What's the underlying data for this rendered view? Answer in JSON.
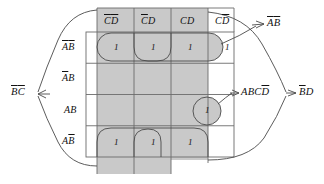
{
  "figure": {
    "type": "karnaugh-map",
    "variables": [
      "A",
      "B",
      "C",
      "D"
    ],
    "colors": {
      "group_fill": "#c9c9c9",
      "grid_line": "#6b6b6b",
      "outline": "#3a3a3a",
      "text": "#111111",
      "background": "#ffffff"
    }
  },
  "column_headers": [
    {
      "id": "col-0",
      "parts": [
        {
          "t": "C",
          "bar": true
        },
        {
          "t": "D",
          "bar": true
        }
      ]
    },
    {
      "id": "col-1",
      "parts": [
        {
          "t": "C",
          "bar": true
        },
        {
          "t": "D",
          "bar": false
        }
      ]
    },
    {
      "id": "col-2",
      "parts": [
        {
          "t": "C",
          "bar": false
        },
        {
          "t": "D",
          "bar": false
        }
      ]
    },
    {
      "id": "col-3",
      "parts": [
        {
          "t": "C",
          "bar": false
        },
        {
          "t": "D",
          "bar": true
        }
      ]
    }
  ],
  "row_headers": [
    {
      "id": "row-0",
      "parts": [
        {
          "t": "A",
          "bar": true
        },
        {
          "t": "B",
          "bar": true
        }
      ]
    },
    {
      "id": "row-1",
      "parts": [
        {
          "t": "A",
          "bar": true
        },
        {
          "t": "B",
          "bar": false
        }
      ]
    },
    {
      "id": "row-2",
      "parts": [
        {
          "t": "A",
          "bar": false
        },
        {
          "t": "B",
          "bar": false
        }
      ]
    },
    {
      "id": "row-3",
      "parts": [
        {
          "t": "A",
          "bar": false
        },
        {
          "t": "B",
          "bar": true
        }
      ]
    }
  ],
  "cells": [
    {
      "row": 0,
      "col": 0,
      "value": "1"
    },
    {
      "row": 0,
      "col": 1,
      "value": "1"
    },
    {
      "row": 0,
      "col": 2,
      "value": "1"
    },
    {
      "row": 0,
      "col": 3,
      "value": "1"
    },
    {
      "row": 1,
      "col": 0,
      "value": ""
    },
    {
      "row": 1,
      "col": 1,
      "value": ""
    },
    {
      "row": 1,
      "col": 2,
      "value": ""
    },
    {
      "row": 1,
      "col": 3,
      "value": ""
    },
    {
      "row": 2,
      "col": 0,
      "value": ""
    },
    {
      "row": 2,
      "col": 1,
      "value": ""
    },
    {
      "row": 2,
      "col": 2,
      "value": ""
    },
    {
      "row": 2,
      "col": 3,
      "value": "1"
    },
    {
      "row": 3,
      "col": 0,
      "value": "1"
    },
    {
      "row": 3,
      "col": 1,
      "value": "1"
    },
    {
      "row": 3,
      "col": 2,
      "value": "1"
    },
    {
      "row": 3,
      "col": 3,
      "value": ""
    }
  ],
  "term_labels": [
    {
      "id": "term-ab-bar",
      "parts": [
        {
          "t": "A",
          "bar": true
        },
        {
          "t": "B",
          "bar": true
        }
      ],
      "x": 268,
      "y": 26
    },
    {
      "id": "term-abcd-bar",
      "parts": [
        {
          "t": "A",
          "bar": false
        },
        {
          "t": "B",
          "bar": false
        },
        {
          "t": "C",
          "bar": false
        },
        {
          "t": "D",
          "bar": true
        }
      ],
      "x": 240,
      "y": 93
    },
    {
      "id": "term-b-bar-d",
      "parts": [
        {
          "t": "B",
          "bar": true
        },
        {
          "t": "D",
          "bar": false
        }
      ],
      "x": 300,
      "y": 93
    },
    {
      "id": "term-b-bar-c-bar",
      "parts": [
        {
          "t": "B",
          "bar": true
        },
        {
          "t": "C",
          "bar": true
        }
      ],
      "x": 12,
      "y": 93
    }
  ],
  "groups": [
    {
      "id": "group-a-bar-b-bar",
      "description": "row ABbar all four columns"
    },
    {
      "id": "group-abcd-bar",
      "description": "single minterm AB CDbar"
    },
    {
      "id": "group-b-bar-d",
      "description": "columns CbarD and CD wrap vertical band"
    },
    {
      "id": "group-b-bar-c-bar",
      "description": "columns CbarDbar and CbarD wrap vertical band"
    }
  ]
}
